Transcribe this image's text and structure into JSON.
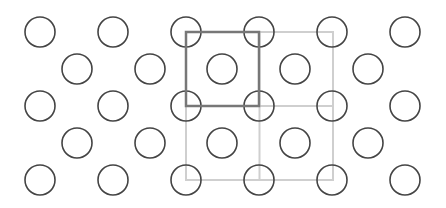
{
  "diagram": {
    "width": 446,
    "height": 208,
    "circle_radius": 15,
    "colors": {
      "background": "#ffffff",
      "circle_stroke": "#444444",
      "primitive_cell": "#777777",
      "supercell": "#cfcfcf"
    },
    "corner_rows": {
      "ys": [
        32,
        106,
        180
      ],
      "xs": [
        40,
        113,
        186,
        259,
        332,
        405
      ]
    },
    "center_rows": {
      "ys": [
        69,
        143
      ],
      "xs": [
        77,
        150,
        222,
        295,
        368
      ]
    },
    "primitive_cell": {
      "x": 186,
      "y": 32,
      "w": 73,
      "h": 74
    },
    "supercell": {
      "x": 186,
      "y": 32,
      "w": 147,
      "h": 148
    }
  }
}
